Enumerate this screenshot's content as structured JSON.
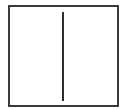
{
  "diagram": {
    "shapes": [
      {
        "type": "rectangle",
        "role": "outer-frame",
        "stroke": "#3a3a3a"
      },
      {
        "type": "line",
        "orientation": "vertical",
        "role": "center-divider",
        "stroke": "#2e2e2e"
      }
    ],
    "colors": {
      "background": "#ffffff",
      "frame_stroke": "#3a3a3a",
      "divider_stroke": "#2e2e2e"
    }
  }
}
